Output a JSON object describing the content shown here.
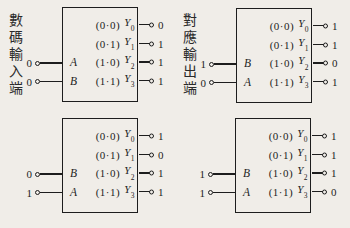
{
  "colors": {
    "background": "#f0ede8",
    "ink": "#1d1d1d"
  },
  "labels": {
    "input_terminal": "數碼輸入端",
    "output_terminal": "對應輸出端"
  },
  "modules": [
    {
      "name": "top-left-decoder",
      "inputs": [
        {
          "port": "A",
          "value": "0"
        },
        {
          "port": "B",
          "value": "0"
        }
      ],
      "rows": [
        {
          "pair": "(0·0)",
          "y": "Y",
          "sub": "0",
          "out": "0"
        },
        {
          "pair": "(0·1)",
          "y": "Y",
          "sub": "1",
          "out": "1"
        },
        {
          "pair": "(1·0)",
          "y": "Y",
          "sub": "2",
          "out": "1"
        },
        {
          "pair": "(1·1)",
          "y": "Y",
          "sub": "3",
          "out": "1"
        }
      ]
    },
    {
      "name": "top-right-decoder",
      "inputs": [
        {
          "port": "B",
          "value": "1"
        },
        {
          "port": "A",
          "value": "0"
        }
      ],
      "rows": [
        {
          "pair": "(0·0)",
          "y": "Y",
          "sub": "0",
          "out": "1"
        },
        {
          "pair": "(0·1)",
          "y": "Y",
          "sub": "1",
          "out": "1"
        },
        {
          "pair": "(1·0)",
          "y": "Y",
          "sub": "2",
          "out": "0"
        },
        {
          "pair": "(1·1)",
          "y": "Y",
          "sub": "3",
          "out": "1"
        }
      ]
    },
    {
      "name": "bottom-left-decoder",
      "inputs": [
        {
          "port": "B",
          "value": "0"
        },
        {
          "port": "A",
          "value": "1"
        }
      ],
      "rows": [
        {
          "pair": "(0·0)",
          "y": "Y",
          "sub": "0",
          "out": "1"
        },
        {
          "pair": "(0·1)",
          "y": "Y",
          "sub": "1",
          "out": "0"
        },
        {
          "pair": "(1·0)",
          "y": "Y",
          "sub": "2",
          "out": "1"
        },
        {
          "pair": "(1·1)",
          "y": "Y",
          "sub": "3",
          "out": "1"
        }
      ]
    },
    {
      "name": "bottom-right-decoder",
      "inputs": [
        {
          "port": "B",
          "value": "1"
        },
        {
          "port": "A",
          "value": "1"
        }
      ],
      "rows": [
        {
          "pair": "(0·0)",
          "y": "Y",
          "sub": "0",
          "out": "1"
        },
        {
          "pair": "(0·1)",
          "y": "Y",
          "sub": "1",
          "out": "1"
        },
        {
          "pair": "(1·0)",
          "y": "Y",
          "sub": "2",
          "out": "1"
        },
        {
          "pair": "(1·1)",
          "y": "Y",
          "sub": "3",
          "out": "0"
        }
      ]
    }
  ]
}
